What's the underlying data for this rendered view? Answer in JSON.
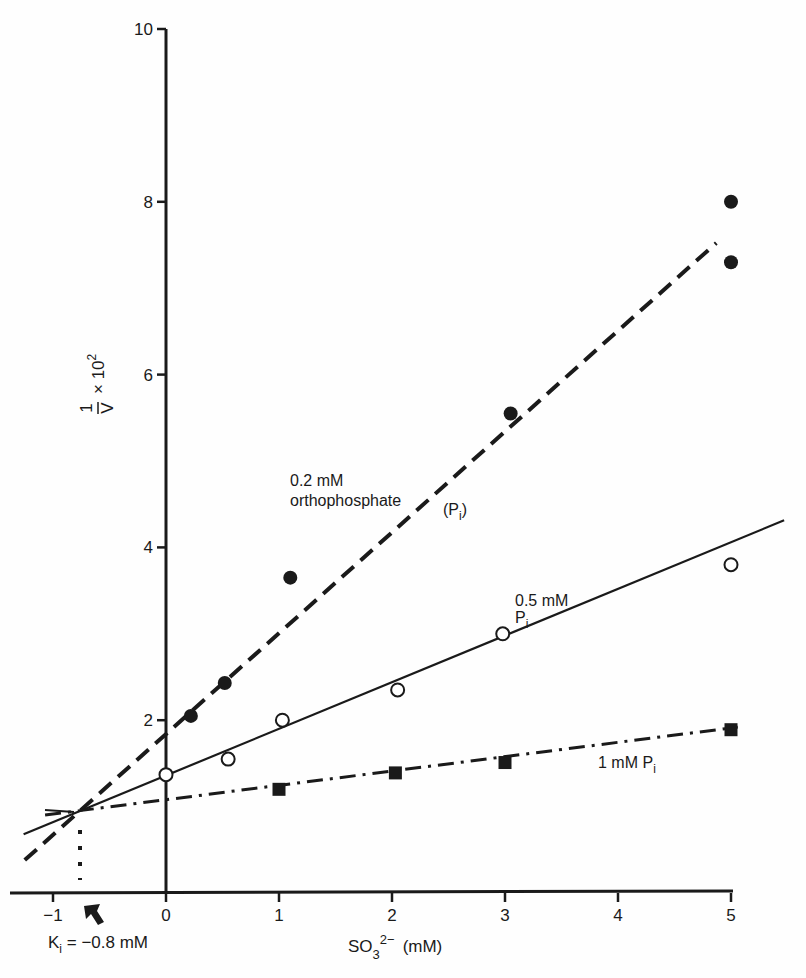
{
  "chart_data": {
    "type": "line",
    "title": "",
    "xlabel": "SO3 2− (mM)",
    "xlabel_parts": {
      "base": "SO",
      "sub": "3",
      "sup": "2−",
      "unit": "(mM)"
    },
    "ylabel": "1/V × 10²",
    "ylabel_parts": {
      "num": "1",
      "den": "V",
      "mult": "× 10",
      "sup": "2"
    },
    "xlim": [
      -1.3,
      5.6
    ],
    "ylim": [
      0,
      10
    ],
    "x_ticks": [
      -1,
      0,
      1,
      2,
      3,
      4,
      5
    ],
    "x_tick_labels": [
      "−1",
      "0",
      "1",
      "2",
      "3",
      "4",
      "5"
    ],
    "y_ticks": [
      2,
      4,
      6,
      8,
      10
    ],
    "y_tick_labels": [
      "2",
      "4",
      "6",
      "8",
      "10"
    ],
    "grid": false,
    "legend": "inline annotations",
    "series": [
      {
        "name": "0.2 mM orthophosphate (Pi)",
        "marker": "filled-circle",
        "line_style": "dashed",
        "fit": {
          "slope": 1.167,
          "intercept": 1.84,
          "x_start": -1.25,
          "x_end": 4.87
        },
        "points": [
          {
            "x": 0.22,
            "y": 2.05
          },
          {
            "x": 0.52,
            "y": 2.43
          },
          {
            "x": 1.1,
            "y": 3.65
          },
          {
            "x": 3.05,
            "y": 5.55
          },
          {
            "x": 5.0,
            "y": 7.3
          },
          {
            "x": 5.0,
            "y": 8.0
          }
        ]
      },
      {
        "name": "0.5 mM Pi",
        "marker": "open-circle",
        "line_style": "solid",
        "fit": {
          "slope": 0.54,
          "intercept": 1.36,
          "x_start": -1.26,
          "x_end": 5.47
        },
        "points": [
          {
            "x": 0.0,
            "y": 1.37
          },
          {
            "x": 0.55,
            "y": 1.55
          },
          {
            "x": 1.03,
            "y": 2.0
          },
          {
            "x": 2.05,
            "y": 2.35
          },
          {
            "x": 2.98,
            "y": 3.0
          },
          {
            "x": 5.0,
            "y": 3.8
          }
        ]
      },
      {
        "name": "1 mM Pi",
        "marker": "filled-square",
        "line_style": "dash-dot",
        "fit": {
          "slope": 0.166,
          "intercept": 1.08,
          "x_start": -1.07,
          "x_end": 5.06
        },
        "points": [
          {
            "x": 1.0,
            "y": 1.2
          },
          {
            "x": 2.03,
            "y": 1.39
          },
          {
            "x": 3.0,
            "y": 1.51
          },
          {
            "x": 5.0,
            "y": 1.89
          }
        ]
      }
    ],
    "annotations": [
      {
        "id": "label-02",
        "lines": [
          "0.2 mM",
          "orthophosphate"
        ],
        "extra": "(Pi)"
      },
      {
        "id": "label-05",
        "lines": [
          "0.5 mM",
          "Pi"
        ]
      },
      {
        "id": "label-1",
        "lines": [
          "1 mM Pi"
        ]
      },
      {
        "id": "ki",
        "text": "Ki = −0.8 mM",
        "x": -0.8,
        "y": 0.93
      }
    ],
    "intersection": {
      "x": -0.77,
      "y": 0.93
    }
  },
  "labels": {
    "ann_02_line1": "0.2 mM",
    "ann_02_line2": "orthophosphate",
    "ann_02_pi_P": "(P",
    "ann_02_pi_i": "i",
    "ann_02_pi_close": ")",
    "ann_05_line1": "0.5 mM",
    "ann_05_P": "P",
    "ann_05_i": "i",
    "ann_1_text": "1 mM P",
    "ann_1_i": "i",
    "ki_K": "K",
    "ki_i": "i",
    "ki_rest": " = −0.8 mM",
    "xlabel_base": "SO",
    "xlabel_sub": "3",
    "xlabel_sup": "2−",
    "xlabel_unit": "(mM)",
    "ylabel_num": "1",
    "ylabel_den": "V",
    "ylabel_mult": "× 10",
    "ylabel_sup": "2"
  },
  "colors": {
    "ink": "#1a1a1a",
    "background": "#fefefe"
  }
}
